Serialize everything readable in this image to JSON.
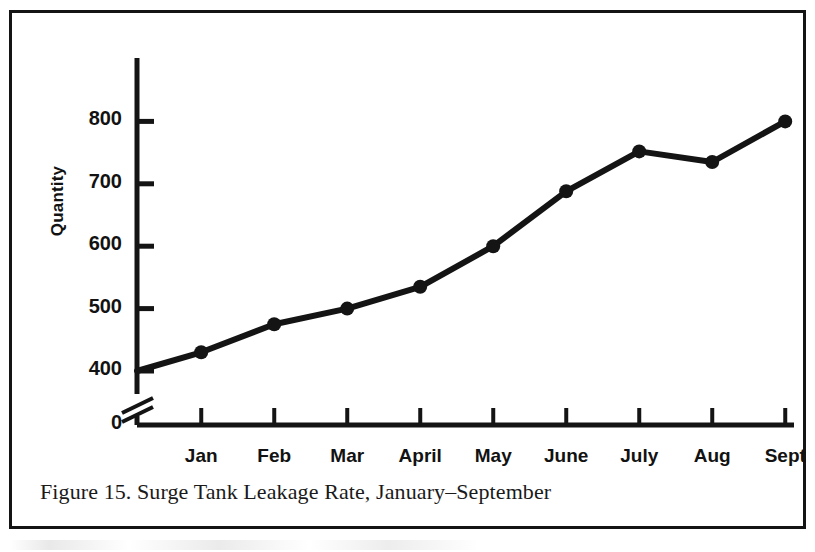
{
  "figure": {
    "caption": "Figure 15.  Surge Tank Leakage Rate, January–September"
  },
  "chart_data": {
    "type": "line",
    "title": "",
    "subtitle": "",
    "xlabel": "",
    "ylabel": "Quantity",
    "categories": [
      "Jan",
      "Feb",
      "Mar",
      "April",
      "May",
      "June",
      "July",
      "Aug",
      "Sept"
    ],
    "values": [
      430,
      475,
      500,
      535,
      600,
      688,
      752,
      735,
      800
    ],
    "origin_value": 400,
    "ylim": [
      0,
      860
    ],
    "yticks": [
      0,
      400,
      500,
      600,
      700,
      800
    ],
    "ytick_labels": [
      "0",
      "400",
      "500",
      "600",
      "700",
      "800"
    ],
    "axis_break": true,
    "axis_break_note": "y-axis broken between 0 and 400",
    "grid": false,
    "legend": "none",
    "marker": "filled-circle",
    "line_color": "#141414",
    "marker_color": "#141414",
    "background_color": "#ffffff"
  },
  "colors": {
    "ink": "#141414",
    "frame": "#141414",
    "paper": "#ffffff"
  },
  "icons": {
    "axis_break": "axis-break-icon"
  }
}
